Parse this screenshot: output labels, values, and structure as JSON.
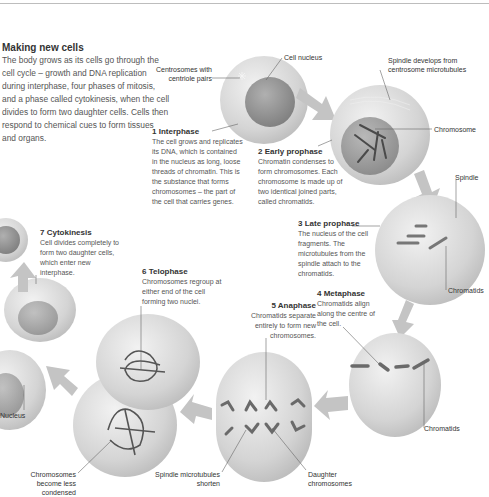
{
  "intro": {
    "title": "Making new cells",
    "body": "The body grows as its cells go through the cell cycle – growth and DNA replication during interphase, four phases of mitosis, and a phase called cytokinesis, when the cell divides to form two daughter cells. Cells then respond to chemical cues to form tissues and organs."
  },
  "stages": [
    {
      "number": "1",
      "title": "Interphase",
      "text": "The cell grows and replicates its DNA, which is contained in the nucleus as long, loose threads of chromatin. This is the substance that forms chromosomes – the part of the cell that carries genes."
    },
    {
      "number": "2",
      "title": "Early prophase",
      "text": "Chromatin condenses to form chromosomes. Each chromosome is made up of two identical joined parts, called chromatids."
    },
    {
      "number": "3",
      "title": "Late prophase",
      "text": "The nucleus of the cell fragments. The microtubules from the spindle attach to the chromatids."
    },
    {
      "number": "4",
      "title": "Metaphase",
      "text": "Chromatids align along the centre of the cell."
    },
    {
      "number": "5",
      "title": "Anaphase",
      "text": "Chromatids separate entirely to form new chromosomes."
    },
    {
      "number": "6",
      "title": "Telophase",
      "text": "Chromosomes regroup at either end of the cell forming two nuclei."
    },
    {
      "number": "7",
      "title": "Cytokinesis",
      "text": "Cell divides completely to form two daughter cells, which enter new interphase."
    }
  ],
  "labels": {
    "cell_nucleus": "Cell nucleus",
    "centrosomes": "Centrosomes with centriole pairs",
    "spindle_develops": "Spindle develops from centrosome microtubules",
    "chromosome": "Chromosome",
    "spindle": "Spindle",
    "chromatids_1": "Chromatids",
    "chromatids_2": "Chromatids",
    "nucleus": "Nucleus",
    "chromosomes_less_condensed": "Chromosomes become less condensed",
    "spindle_microtubules_shorten": "Spindle microtubules shorten",
    "daughter_chromosomes": "Daughter chromosomes"
  },
  "colors": {
    "cell_fill": "#d9d9d9",
    "nucleus_fill": "#9a9a9a",
    "chromosome": "#5a5a5a",
    "arrow": "#c4c4c4",
    "leader_line": "#666666"
  }
}
